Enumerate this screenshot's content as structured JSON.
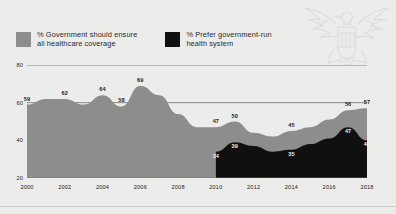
{
  "legend": {
    "items": [
      {
        "label": "% Government should ensure\nall healthcare coverage",
        "color": "#8d8d8b",
        "key": "ensure_coverage"
      },
      {
        "label": "% Prefer government-run\nhealth system",
        "color": "#101010",
        "key": "govt_run"
      }
    ]
  },
  "axes": {
    "y_ticks": [
      "20",
      "40",
      "60",
      "80"
    ],
    "x_ticks": [
      "2000",
      "2002",
      "2004",
      "2006",
      "2008",
      "2010",
      "2012",
      "2014",
      "2016",
      "2018"
    ]
  },
  "watermark": {
    "name": "eagle-emblem"
  },
  "chart_data": {
    "type": "area",
    "title": "",
    "xlabel": "",
    "ylabel": "",
    "ylim": [
      20,
      80
    ],
    "xlim": [
      2000,
      2018
    ],
    "grid": true,
    "legend_position": "top-left",
    "x": [
      2000,
      2001,
      2002,
      2003,
      2004,
      2005,
      2006,
      2007,
      2008,
      2009,
      2010,
      2011,
      2012,
      2013,
      2014,
      2015,
      2016,
      2017,
      2018
    ],
    "series": [
      {
        "name": "% Government should ensure all healthcare coverage",
        "color": "#8d8d8b",
        "values": [
          59,
          62,
          62,
          59,
          64,
          58,
          69,
          64,
          54,
          47,
          47,
          50,
          44,
          42,
          45,
          47,
          51,
          56,
          57
        ],
        "labels": [
          {
            "x": 2000,
            "value": 59
          },
          {
            "x": 2002,
            "value": 62
          },
          {
            "x": 2004,
            "value": 64
          },
          {
            "x": 2005,
            "value": 58
          },
          {
            "x": 2006,
            "value": 69
          },
          {
            "x": 2010,
            "value": 47
          },
          {
            "x": 2011,
            "value": 50
          },
          {
            "x": 2014,
            "value": 45
          },
          {
            "x": 2017,
            "value": 56
          },
          {
            "x": 2018,
            "value": 57
          }
        ]
      },
      {
        "name": "% Prefer government-run health system",
        "color": "#101010",
        "values": [
          null,
          null,
          null,
          null,
          null,
          null,
          null,
          null,
          null,
          null,
          34,
          39,
          37,
          34,
          35,
          38,
          41,
          47,
          40
        ],
        "labels": [
          {
            "x": 2010,
            "value": 34
          },
          {
            "x": 2011,
            "value": 39
          },
          {
            "x": 2014,
            "value": 35
          },
          {
            "x": 2017,
            "value": 47
          },
          {
            "x": 2018,
            "value": 40
          }
        ]
      }
    ]
  }
}
